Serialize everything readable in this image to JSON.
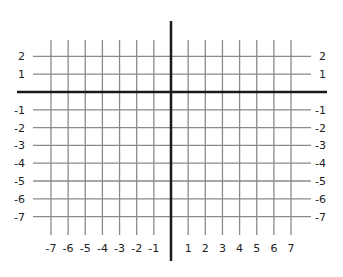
{
  "diagram": {
    "type": "coordinate-plane",
    "x_range": [
      -7,
      7
    ],
    "y_range": [
      -7,
      2
    ],
    "x_tick_labels": [
      "-7",
      "-6",
      "-5",
      "-4",
      "-3",
      "-2",
      "-1",
      "1",
      "2",
      "3",
      "4",
      "5",
      "6",
      "7"
    ],
    "y_tick_labels_left": [
      "2",
      "1",
      "-1",
      "-2",
      "-3",
      "-4",
      "-5",
      "-6",
      "-7"
    ],
    "y_tick_labels_right": [
      "2",
      "1",
      "-1",
      "-2",
      "-3",
      "-4",
      "-5",
      "-6",
      "-7"
    ],
    "colors": {
      "grid": "#8a8a8a",
      "axis": "#1a1a1a",
      "label": "#222222",
      "background": "#ffffff"
    }
  }
}
